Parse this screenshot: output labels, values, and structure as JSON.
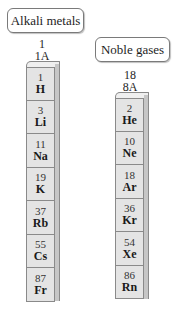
{
  "groups": [
    {
      "label": "Alkali metals",
      "group_number": "1",
      "group_label": "1A",
      "elements": [
        {
          "number": "1",
          "symbol": "H"
        },
        {
          "number": "3",
          "symbol": "Li"
        },
        {
          "number": "11",
          "symbol": "Na"
        },
        {
          "number": "19",
          "symbol": "K"
        },
        {
          "number": "37",
          "symbol": "Rb"
        },
        {
          "number": "55",
          "symbol": "Cs"
        },
        {
          "number": "87",
          "symbol": "Fr"
        }
      ]
    },
    {
      "label": "Noble gases",
      "group_number": "18",
      "group_label": "8A",
      "elements": [
        {
          "number": "2",
          "symbol": "He"
        },
        {
          "number": "10",
          "symbol": "Ne"
        },
        {
          "number": "18",
          "symbol": "Ar"
        },
        {
          "number": "36",
          "symbol": "Kr"
        },
        {
          "number": "54",
          "symbol": "Xe"
        },
        {
          "number": "86",
          "symbol": "Rn"
        }
      ]
    }
  ],
  "colors": {
    "cell_fill": "#e4e4e4",
    "side_fill": "#c6c6c6",
    "border": "#8a8a8a"
  }
}
